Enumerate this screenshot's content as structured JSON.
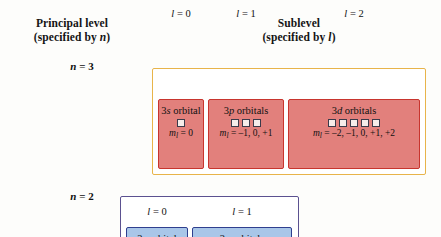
{
  "headers": {
    "principal": {
      "line1": "Principal level",
      "line2_prefix": "(specified by ",
      "line2_symbol": "n",
      "line2_suffix": ")"
    },
    "sublevel": {
      "line1": "Sublevel",
      "line2_prefix": "(specified by ",
      "line2_symbol": "l",
      "line2_suffix": ")"
    }
  },
  "levels": [
    {
      "id": "n3",
      "n_prefix": "n",
      "n_eq": " = ",
      "n_value": "3",
      "n_label_full": "n = 3",
      "box_border_color": "#e8b44a",
      "card_fill_color": "#e2807c",
      "card_border_color": "#c8352e",
      "sublevels": [
        {
          "l_symbol": "l",
          "l_eq": " = ",
          "l_value": "0",
          "l_label_full": "l = 0",
          "title_prefix": "3",
          "title_letter": "s",
          "title_suffix": " orbital",
          "title_full": "3s orbital",
          "orbital_count": 1,
          "ml_symbol": "m",
          "ml_subscript": "l",
          "ml_eq": " = ",
          "ml_values": "0",
          "ml_full": "ml = 0"
        },
        {
          "l_symbol": "l",
          "l_eq": " = ",
          "l_value": "1",
          "l_label_full": "l = 1",
          "title_prefix": "3",
          "title_letter": "p",
          "title_suffix": " orbitals",
          "title_full": "3p orbitals",
          "orbital_count": 3,
          "ml_symbol": "m",
          "ml_subscript": "l",
          "ml_eq": " = ",
          "ml_values": "–1, 0, +1",
          "ml_full": "ml = –1, 0, +1"
        },
        {
          "l_symbol": "l",
          "l_eq": " = ",
          "l_value": "2",
          "l_label_full": "l = 2",
          "title_prefix": "3",
          "title_letter": "d",
          "title_suffix": " orbitals",
          "title_full": "3d orbitals",
          "orbital_count": 5,
          "ml_symbol": "m",
          "ml_subscript": "l",
          "ml_eq": " = ",
          "ml_values": "–2, –1, 0, +1, +2",
          "ml_full": "ml = –2, –1, 0, +1, +2"
        }
      ]
    },
    {
      "id": "n2",
      "n_prefix": "n",
      "n_eq": " = ",
      "n_value": "2",
      "n_label_full": "n = 2",
      "box_border_color": "#5b5190",
      "card_fill_color": "#a9c6e8",
      "card_border_color": "#2f3f8f",
      "sublevels": [
        {
          "l_symbol": "l",
          "l_eq": " = ",
          "l_value": "0",
          "l_label_full": "l = 0",
          "title_prefix": "2",
          "title_letter": "s",
          "title_suffix": " orbital",
          "title_full": "2s orbital",
          "orbital_count": 1,
          "ml_symbol": "m",
          "ml_subscript": "l",
          "ml_eq": " = ",
          "ml_values": "0",
          "ml_full": "ml = 0"
        },
        {
          "l_symbol": "l",
          "l_eq": " = ",
          "l_value": "1",
          "l_label_full": "l = 1",
          "title_prefix": "2",
          "title_letter": "p",
          "title_suffix": " orbitals",
          "title_full": "2p orbitals",
          "orbital_count": 3,
          "ml_symbol": "m",
          "ml_subscript": "l",
          "ml_eq": " = ",
          "ml_values": "–1, 0, +1",
          "ml_full": "ml = –1, 0, +1"
        }
      ]
    }
  ]
}
